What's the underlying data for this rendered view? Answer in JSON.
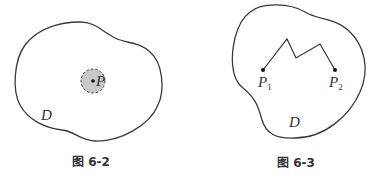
{
  "figures": [
    {
      "id": "fig-6-2",
      "caption": "图 6-2",
      "region_label": "D",
      "point_label": "P",
      "elements": [
        "closed region boundary D",
        "shaded dashed disc (neighborhood) around point P"
      ]
    },
    {
      "id": "fig-6-3",
      "caption": "图 6-3",
      "region_label": "D",
      "points": [
        {
          "label": "P",
          "subscript": "1"
        },
        {
          "label": "P",
          "subscript": "2"
        }
      ],
      "elements": [
        "closed region boundary D",
        "polygonal (broken) line connecting P1 and P2 inside D"
      ]
    }
  ],
  "colors": {
    "stroke": "#3a3a3a",
    "disc_fill": "#c8c8c8",
    "background": "#ffffff"
  }
}
